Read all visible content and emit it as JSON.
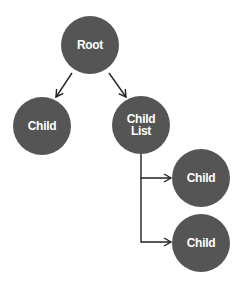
{
  "diagram": {
    "type": "tree",
    "colors": {
      "node_fill": "#555555",
      "node_text": "#ffffff",
      "edge": "#222222",
      "background": "#ffffff"
    },
    "nodes": [
      {
        "id": "root",
        "label_lines": [
          "Root"
        ],
        "cx": 90,
        "cy": 45
      },
      {
        "id": "child-left",
        "label_lines": [
          "Child"
        ],
        "cx": 42,
        "cy": 126
      },
      {
        "id": "child-list",
        "label_lines": [
          "Child",
          "List"
        ],
        "cx": 141,
        "cy": 125
      },
      {
        "id": "child-right-1",
        "label_lines": [
          "Child"
        ],
        "cx": 201,
        "cy": 178
      },
      {
        "id": "child-right-2",
        "label_lines": [
          "Child"
        ],
        "cx": 201,
        "cy": 243
      }
    ],
    "edges": [
      {
        "from": "root",
        "to": "child-left",
        "style": "diagonal-arrow"
      },
      {
        "from": "root",
        "to": "child-list",
        "style": "diagonal-arrow"
      },
      {
        "from": "child-list",
        "to": "child-right-1",
        "style": "elbow-arrow"
      },
      {
        "from": "child-list",
        "to": "child-right-2",
        "style": "elbow-arrow"
      }
    ]
  }
}
